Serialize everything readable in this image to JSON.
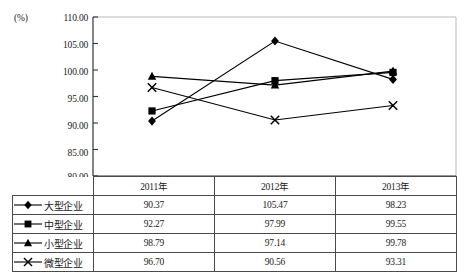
{
  "chart_data": {
    "type": "line",
    "title": "",
    "subtitle": "",
    "xlabel": "",
    "ylabel": "(%)",
    "unit_label": "(%)",
    "categories": [
      "2011年",
      "2012年",
      "2013年"
    ],
    "ylim": [
      80.0,
      110.0
    ],
    "ytick_step": 5.0,
    "yticks": [
      "110.00",
      "105.00",
      "100.00",
      "95.00",
      "90.00",
      "85.00",
      "80.00"
    ],
    "ytick_values": [
      110.0,
      105.0,
      100.0,
      95.0,
      90.0,
      85.0,
      80.0
    ],
    "grid": false,
    "legend_position": "table-left-column",
    "series": [
      {
        "name": "大型企业",
        "marker": "diamond",
        "color": "#000000",
        "values": [
          90.37,
          105.47,
          98.23
        ],
        "value_labels": [
          "90.37",
          "105.47",
          "98.23"
        ]
      },
      {
        "name": "中型企业",
        "marker": "square",
        "color": "#000000",
        "values": [
          92.27,
          97.99,
          99.55
        ],
        "value_labels": [
          "92.27",
          "97.99",
          "99.55"
        ]
      },
      {
        "name": "小型企业",
        "marker": "triangle",
        "color": "#000000",
        "values": [
          98.79,
          97.14,
          99.78
        ],
        "value_labels": [
          "98.79",
          "97.14",
          "99.78"
        ]
      },
      {
        "name": "微型企业",
        "marker": "x",
        "color": "#000000",
        "values": [
          96.7,
          90.56,
          93.31
        ],
        "value_labels": [
          "96.70",
          "90.56",
          "93.31"
        ]
      }
    ]
  },
  "table": {
    "header": [
      "",
      "2011年",
      "2012年",
      "2013年"
    ],
    "rows": [
      {
        "label": "大型企业",
        "marker": "diamond",
        "cells": [
          "90.37",
          "105.47",
          "98.23"
        ]
      },
      {
        "label": "中型企业",
        "marker": "square",
        "cells": [
          "92.27",
          "97.99",
          "99.55"
        ]
      },
      {
        "label": "小型企业",
        "marker": "triangle",
        "cells": [
          "98.79",
          "97.14",
          "99.78"
        ]
      },
      {
        "label": "微型企业",
        "marker": "x",
        "cells": [
          "96.70",
          "90.56",
          "93.31"
        ]
      }
    ]
  },
  "colors": {
    "axis": "#333333",
    "series": "#000000",
    "table_border": "#4a4a4a",
    "plot_border": "#b9b9b9"
  }
}
